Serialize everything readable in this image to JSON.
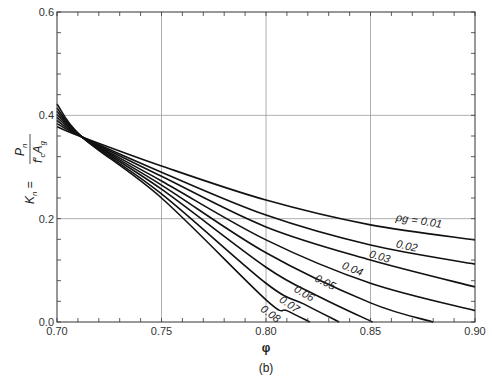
{
  "chart_data": {
    "type": "line",
    "title": "",
    "caption": "(b)",
    "xlabel": "φ",
    "ylabel": "K_n = P_n / (f'_c A_g)",
    "ylabel_parts": {
      "lhs": "K",
      "lhs_sub": "n",
      "num": "P",
      "num_sub": "n",
      "den_f": "f",
      "den_f_sub": "c",
      "den_a": "A",
      "den_a_sub": "g"
    },
    "xlim": [
      0.7,
      0.9
    ],
    "ylim": [
      0.0,
      0.6
    ],
    "x_ticks": [
      "0.70",
      "0.75",
      "0.80",
      "0.85",
      "0.90"
    ],
    "x_tick_values": [
      0.7,
      0.75,
      0.8,
      0.85,
      0.9
    ],
    "y_ticks": [
      "0.0",
      "0.2",
      "0.4",
      "0.6"
    ],
    "y_tick_values": [
      0.0,
      0.2,
      0.4,
      0.6
    ],
    "x_minor_step": 0.01,
    "y_minor_step": 0.04,
    "grid": {
      "x": [
        0.75,
        0.8,
        0.85
      ],
      "y": [
        0.2,
        0.4
      ]
    },
    "legend": "inline curve labels",
    "series": [
      {
        "name": "ρg = 0.01",
        "label": "0.01",
        "x": [
          0.7,
          0.712,
          0.75,
          0.8,
          0.85,
          0.9
        ],
        "y": [
          0.378,
          0.358,
          0.302,
          0.236,
          0.188,
          0.159
        ]
      },
      {
        "name": "ρg = 0.02",
        "label": "0.02",
        "x": [
          0.7,
          0.712,
          0.75,
          0.8,
          0.85,
          0.9
        ],
        "y": [
          0.384,
          0.358,
          0.29,
          0.207,
          0.149,
          0.112
        ]
      },
      {
        "name": "ρg = 0.03",
        "label": "0.03",
        "x": [
          0.7,
          0.712,
          0.75,
          0.8,
          0.85,
          0.9
        ],
        "y": [
          0.39,
          0.358,
          0.282,
          0.184,
          0.12,
          0.068
        ]
      },
      {
        "name": "ρg = 0.04",
        "label": "0.04",
        "x": [
          0.7,
          0.712,
          0.75,
          0.8,
          0.85,
          0.9
        ],
        "y": [
          0.396,
          0.358,
          0.273,
          0.159,
          0.075,
          0.022
        ]
      },
      {
        "name": "ρg = 0.05",
        "label": "0.05",
        "x": [
          0.7,
          0.712,
          0.75,
          0.8,
          0.85,
          0.88
        ],
        "y": [
          0.402,
          0.358,
          0.265,
          0.134,
          0.037,
          0.0
        ]
      },
      {
        "name": "ρg = 0.06",
        "label": "0.06",
        "x": [
          0.7,
          0.712,
          0.75,
          0.8,
          0.825,
          0.851
        ],
        "y": [
          0.408,
          0.358,
          0.257,
          0.106,
          0.05,
          0.0
        ]
      },
      {
        "name": "ρg = 0.07",
        "label": "0.07",
        "x": [
          0.7,
          0.712,
          0.75,
          0.8,
          0.818,
          0.835
        ],
        "y": [
          0.414,
          0.358,
          0.248,
          0.075,
          0.035,
          0.0
        ]
      },
      {
        "name": "ρg = 0.08",
        "label": "0.08",
        "x": [
          0.7,
          0.712,
          0.75,
          0.8,
          0.81,
          0.821
        ],
        "y": [
          0.422,
          0.358,
          0.24,
          0.043,
          0.022,
          0.0
        ]
      }
    ],
    "annotations": [
      {
        "text": "ρg = 0.01",
        "x": 0.862,
        "y": 0.196,
        "angle": 9
      },
      {
        "text": "0.02",
        "x": 0.862,
        "y": 0.145,
        "angle": 13
      },
      {
        "text": "0.03",
        "x": 0.849,
        "y": 0.126,
        "angle": 17
      },
      {
        "text": "0.04",
        "x": 0.836,
        "y": 0.104,
        "angle": 22
      },
      {
        "text": "0.05",
        "x": 0.823,
        "y": 0.08,
        "angle": 27
      },
      {
        "text": "0.06",
        "x": 0.813,
        "y": 0.06,
        "angle": 31
      },
      {
        "text": "0.07",
        "x": 0.806,
        "y": 0.04,
        "angle": 34
      },
      {
        "text": "0.08",
        "x": 0.797,
        "y": 0.022,
        "angle": 36
      }
    ]
  },
  "plot_area": {
    "left": 57,
    "top": 12,
    "right": 475,
    "bottom": 322
  },
  "colors": {
    "curve": "#111111",
    "grid": "#9a9a9a",
    "axis": "#333333"
  }
}
